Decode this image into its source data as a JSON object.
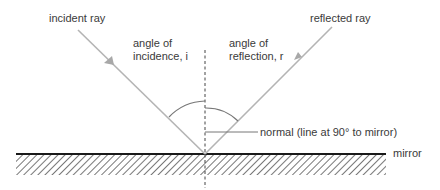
{
  "diagram": {
    "labels": {
      "incident_ray": "incident ray",
      "reflected_ray": "reflected ray",
      "angle_incidence_line1": "angle of",
      "angle_incidence_line2": "incidence, i",
      "angle_reflection_line1": "angle of",
      "angle_reflection_line2": "reflection, r",
      "normal": "normal (line at 90° to mirror)",
      "mirror": "mirror"
    },
    "colors": {
      "ray": "#b4b4b4",
      "text": "#3a3a3a",
      "mirror_line": "#1a1a1a",
      "hatch": "#555555",
      "normal": "#444444",
      "arc": "#777777"
    }
  }
}
